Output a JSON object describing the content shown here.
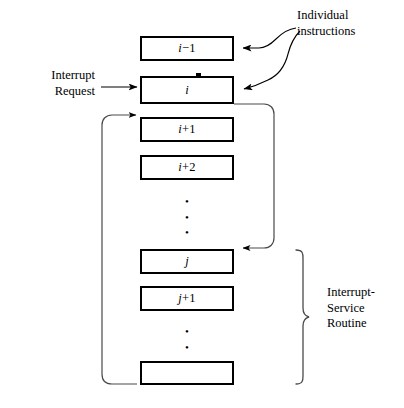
{
  "diagram": {
    "boxes": [
      {
        "name": "box-i-minus-1",
        "label": "i−1",
        "italic_part": "i",
        "rest": "−1"
      },
      {
        "name": "box-i",
        "label": "i",
        "italic_part": "i",
        "rest": ""
      },
      {
        "name": "box-i-plus-1",
        "label": "i+1",
        "italic_part": "i",
        "rest": "+1"
      },
      {
        "name": "box-i-plus-2",
        "label": "i+2",
        "italic_part": "i",
        "rest": "+2"
      },
      {
        "name": "box-j",
        "label": "j",
        "italic_part": "j",
        "rest": ""
      },
      {
        "name": "box-j-plus-1",
        "label": "j+1",
        "italic_part": "j",
        "rest": "+1"
      },
      {
        "name": "box-last",
        "label": "",
        "italic_part": "",
        "rest": ""
      }
    ],
    "ellipsis_glyph": "•",
    "labels": {
      "individual_instructions_line1": "Individual",
      "individual_instructions_line2": "instructions",
      "interrupt_request_line1": "Interrupt",
      "interrupt_request_line2": "Request",
      "isr_line1": "Interrupt-",
      "isr_line2": "Service",
      "isr_line3": "Routine"
    },
    "colors": {
      "stroke": "#000000",
      "box_fill": "#ffffff",
      "background": "#ffffff",
      "thin_stroke": "#3a3a3a"
    }
  }
}
